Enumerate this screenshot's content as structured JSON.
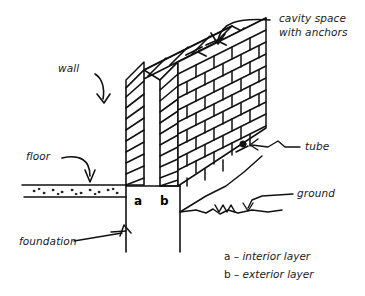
{
  "figure": {
    "background_color": "#ffffff",
    "ink_color": "#111111"
  },
  "labels": {
    "cavity": "cavity space\nwith anchors",
    "wall": "wall",
    "tube": "tube",
    "floor": "floor",
    "ground": "ground",
    "foundation": "foundation"
  },
  "wall_markers": {
    "interior": "a",
    "exterior": "b"
  },
  "key": {
    "interior": {
      "letter": "a",
      "dash": " – ",
      "text": "interior layer"
    },
    "exterior": {
      "letter": "b",
      "dash": " – ",
      "text": "exterior layer"
    }
  }
}
